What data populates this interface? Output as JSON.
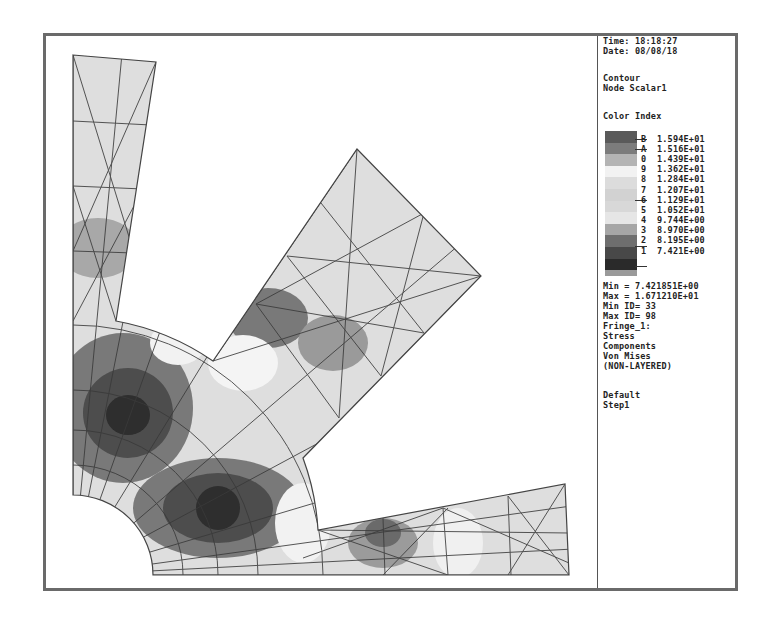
{
  "header": {
    "time": "Time: 18:18:27",
    "date": "Date: 08/08/18"
  },
  "plot": {
    "type_line1": "Contour",
    "type_line2": "Node Scalar1"
  },
  "legend": {
    "title": "Color Index",
    "entries": [
      {
        "index": "B",
        "value": "1.594E+01",
        "color": "#5a5a5a"
      },
      {
        "index": "A",
        "value": "1.516E+01",
        "color": "#7c7c7c"
      },
      {
        "index": "0",
        "value": "1.439E+01",
        "color": "#b4b4b4"
      },
      {
        "index": "9",
        "value": "1.362E+01",
        "color": "#f2f2f2"
      },
      {
        "index": "8",
        "value": "1.284E+01",
        "color": "#dcdcdc"
      },
      {
        "index": "7",
        "value": "1.207E+01",
        "color": "#d2d2d2"
      },
      {
        "index": "6",
        "value": "1.129E+01",
        "color": "#d8d8d8"
      },
      {
        "index": "5",
        "value": "1.052E+01",
        "color": "#e6e6e6"
      },
      {
        "index": "4",
        "value": "9.744E+00",
        "color": "#a6a6a6"
      },
      {
        "index": "3",
        "value": "8.970E+00",
        "color": "#6e6e6e"
      },
      {
        "index": "2",
        "value": "8.195E+00",
        "color": "#484848"
      },
      {
        "index": "1",
        "value": "7.421E+00",
        "color": "#2a2a2a"
      }
    ],
    "bottom_swatch_color": "#9a9a9a"
  },
  "stats": {
    "min": "Min = 7.421851E+00",
    "max": "Max = 1.671210E+01",
    "min_id": "Min ID= 33",
    "max_id": "Max ID= 98"
  },
  "result": {
    "fringe": "Fringe_1:",
    "line1": "Stress",
    "line2": "Components",
    "line3": "Von Mises",
    "line4": "(NON-LAYERED)"
  },
  "subcase": {
    "line1": "Default",
    "line2": "Step1"
  },
  "colors": {
    "frame": "#6a6a6a",
    "mesh_line": "#3a3a3a",
    "light_fill": "#e2e2e2",
    "dark_fill": "#3c3c3c"
  }
}
